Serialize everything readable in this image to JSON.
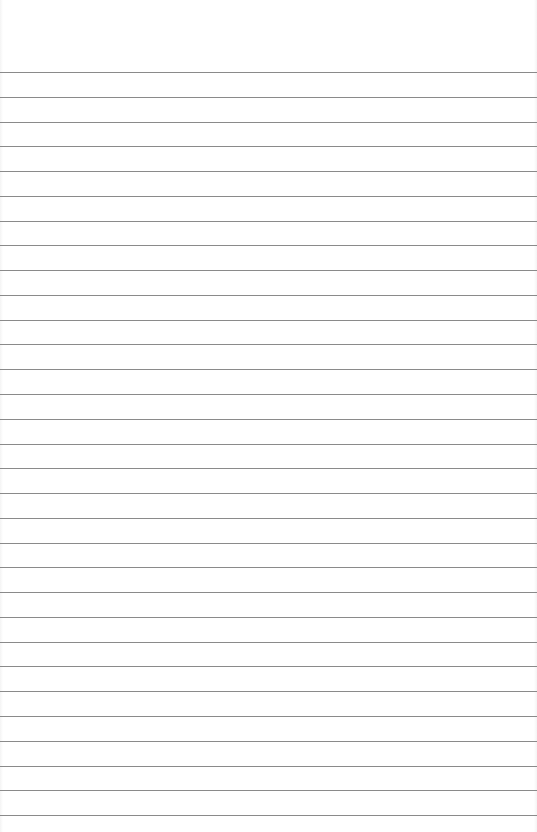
{
  "page": {
    "type": "blank lined paper",
    "line_count": 31,
    "first_line_y": 72,
    "line_spacing": 24.77,
    "line_color": "#8a8a8a",
    "background_color": "#ffffff"
  }
}
